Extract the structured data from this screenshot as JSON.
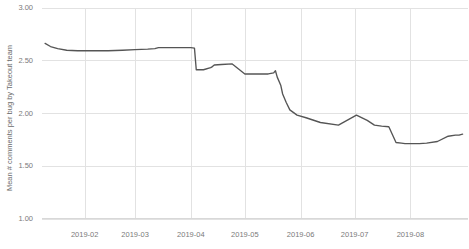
{
  "chart_data": {
    "type": "line",
    "title": "",
    "xlabel": "",
    "ylabel": "Mean # comments per bug by Takeout team",
    "ylim": [
      1.0,
      3.0
    ],
    "yticks": [
      3.0,
      2.5,
      2.0,
      1.5,
      1.0
    ],
    "ytick_labels": [
      "3.00",
      "2.50",
      "2.00",
      "1.50",
      "1.00"
    ],
    "xticks": [
      "2019-02",
      "2019-03",
      "2019-04",
      "2019-05",
      "2019-06",
      "2019-07",
      "2019-08"
    ],
    "xtick_labels": [
      "2019-02",
      "2019-03",
      "2019-04",
      "2019-05",
      "2019-06",
      "2019-07",
      "2019-08"
    ],
    "grid": true,
    "legend": false,
    "legend_position": "none",
    "line_color": "#555555",
    "grid_color": "#e2e2e2",
    "axis_color": "#d8d8d8",
    "text_color": "#7a7a7a",
    "series": [
      {
        "name": "Mean # comments per bug by Takeout team",
        "x": [
          "2019-01-10",
          "2019-01-13",
          "2019-01-17",
          "2019-01-22",
          "2019-01-28",
          "2019-02-05",
          "2019-02-14",
          "2019-02-22",
          "2019-03-01",
          "2019-03-08",
          "2019-03-12",
          "2019-03-13",
          "2019-03-14",
          "2019-03-18",
          "2019-03-23",
          "2019-03-28",
          "2019-04-01",
          "2019-04-03",
          "2019-04-04",
          "2019-04-08",
          "2019-04-12",
          "2019-04-13",
          "2019-04-14",
          "2019-04-18",
          "2019-04-24",
          "2019-05-01",
          "2019-05-08",
          "2019-05-14",
          "2019-05-17",
          "2019-05-18",
          "2019-05-19",
          "2019-05-21",
          "2019-05-22",
          "2019-05-24",
          "2019-05-26",
          "2019-05-30",
          "2019-06-04",
          "2019-06-12",
          "2019-06-22",
          "2019-07-02",
          "2019-07-08",
          "2019-07-12",
          "2019-07-16",
          "2019-07-20",
          "2019-07-24",
          "2019-07-27",
          "2019-07-29",
          "2019-08-02",
          "2019-08-06",
          "2019-08-10",
          "2019-08-16",
          "2019-08-22",
          "2019-08-26",
          "2019-08-28",
          "2019-08-30"
        ],
        "values": [
          2.66,
          2.63,
          2.61,
          2.595,
          2.59,
          2.59,
          2.59,
          2.595,
          2.6,
          2.605,
          2.61,
          2.615,
          2.62,
          2.62,
          2.62,
          2.62,
          2.62,
          2.615,
          2.41,
          2.41,
          2.43,
          2.44,
          2.455,
          2.46,
          2.465,
          2.37,
          2.37,
          2.37,
          2.38,
          2.4,
          2.34,
          2.26,
          2.18,
          2.1,
          2.03,
          1.98,
          1.955,
          1.91,
          1.885,
          1.98,
          1.93,
          1.885,
          1.875,
          1.87,
          1.72,
          1.715,
          1.71,
          1.71,
          1.71,
          1.715,
          1.73,
          1.78,
          1.79,
          1.79,
          1.8
        ]
      }
    ],
    "annotations": []
  },
  "axis": {
    "y_title": "Mean # comments per bug by Takeout team"
  }
}
